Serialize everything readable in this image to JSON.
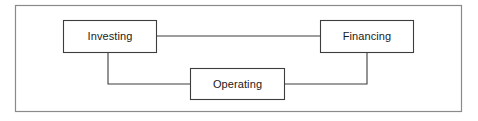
{
  "diagram": {
    "type": "flow-diagram",
    "canvas": {
      "width": 478,
      "height": 121,
      "background": "#ffffff"
    },
    "frame": {
      "name": "outer-border",
      "x": 15,
      "y": 5,
      "width": 447,
      "height": 107,
      "stroke": "#8a8a8a",
      "stroke_width": 1.2,
      "fill": "#ffffff"
    },
    "style": {
      "node_stroke": "#3d3d3d",
      "node_fill": "#ffffff",
      "node_stroke_width": 1.1,
      "connector_stroke": "#3d3d3d",
      "connector_stroke_width": 1.1,
      "label_color": "#1a1a1a"
    },
    "nodes": [
      {
        "id": "investing",
        "label": "Investing",
        "x": 63,
        "y": 20,
        "width": 94,
        "height": 33
      },
      {
        "id": "financing",
        "label": "Financing",
        "x": 320,
        "y": 20,
        "width": 94,
        "height": 33
      },
      {
        "id": "operating",
        "label": "Operating",
        "x": 190,
        "y": 68,
        "width": 95,
        "height": 32
      }
    ],
    "connectors": [
      {
        "id": "investing-financing",
        "from": "investing",
        "to": "financing",
        "shape": "straight-horizontal",
        "points": "157,36 320,36"
      },
      {
        "id": "investing-operating",
        "from": "investing",
        "to": "operating",
        "shape": "elbow-down-right",
        "points": "108,53 108,84 190,84"
      },
      {
        "id": "operating-financing",
        "from": "operating",
        "to": "financing",
        "shape": "elbow-right-up",
        "points": "285,84 367,84 367,53"
      }
    ]
  }
}
